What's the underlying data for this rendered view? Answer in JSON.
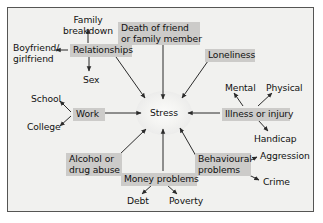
{
  "diagram": {
    "background_color": "#f1f1ef",
    "frame_color": "#555554",
    "shaded_node_color": "#cccbc9",
    "text_color": "#111111",
    "arrow_color": "#2b2b2b",
    "center": {
      "label": "Stress",
      "x": 164,
      "y": 113
    },
    "nodes": [
      {
        "id": "family-breakdown",
        "label": "Family\nbreakdown",
        "style": "plain",
        "x": 62,
        "y": 14,
        "w": 50,
        "align": "center"
      },
      {
        "id": "death-of-friend",
        "label": "Death of friend\nor family member",
        "style": "shaded",
        "x": 118,
        "y": 22,
        "w": 76,
        "align": "left"
      },
      {
        "id": "boyfriend-girlfriend",
        "label": "Boyfriend/\ngirlfriend",
        "style": "plain",
        "x": 12,
        "y": 42,
        "w": 48,
        "align": "left"
      },
      {
        "id": "relationships",
        "label": "Relationships",
        "style": "shaded",
        "x": 70,
        "y": 44,
        "w": 56,
        "align": "left"
      },
      {
        "id": "loneliness",
        "label": "Loneliness",
        "style": "shaded",
        "x": 205,
        "y": 49,
        "w": 44,
        "align": "left"
      },
      {
        "id": "sex",
        "label": "Sex",
        "style": "plain",
        "x": 82,
        "y": 74,
        "w": 20,
        "align": "left"
      },
      {
        "id": "mental",
        "label": "Mental",
        "style": "plain",
        "x": 224,
        "y": 82,
        "w": 28,
        "align": "left"
      },
      {
        "id": "physical",
        "label": "Physical",
        "style": "plain",
        "x": 265,
        "y": 82,
        "w": 32,
        "align": "left"
      },
      {
        "id": "school",
        "label": "School",
        "style": "plain",
        "x": 30,
        "y": 93,
        "w": 28,
        "align": "left"
      },
      {
        "id": "work",
        "label": "Work",
        "style": "shaded",
        "x": 73,
        "y": 108,
        "w": 26,
        "align": "left"
      },
      {
        "id": "illness-or-injury",
        "label": "Illness or injury",
        "style": "shaded",
        "x": 222,
        "y": 108,
        "w": 62,
        "align": "left"
      },
      {
        "id": "college",
        "label": "College",
        "style": "plain",
        "x": 28,
        "y": 121,
        "w": 32,
        "align": "left"
      },
      {
        "id": "handicap",
        "label": "Handicap",
        "style": "plain",
        "x": 253,
        "y": 133,
        "w": 38,
        "align": "left"
      },
      {
        "id": "aggression",
        "label": "Aggression",
        "style": "plain",
        "x": 259,
        "y": 153,
        "w": 44,
        "align": "left"
      },
      {
        "id": "alcohol-drug-abuse",
        "label": "Alcohol or\ndrug abuse",
        "style": "shaded",
        "x": 66,
        "y": 153,
        "w": 50,
        "align": "left"
      },
      {
        "id": "behavioural-problems",
        "label": "Behavioural\nproblems",
        "style": "shaded",
        "x": 195,
        "y": 153,
        "w": 50,
        "align": "left"
      },
      {
        "id": "money-problems",
        "label": "Money problems",
        "style": "shaded",
        "x": 121,
        "y": 173,
        "w": 70,
        "align": "left"
      },
      {
        "id": "crime",
        "label": "Crime",
        "style": "plain",
        "x": 262,
        "y": 177,
        "w": 26,
        "align": "left"
      },
      {
        "id": "debt",
        "label": "Debt",
        "style": "plain",
        "x": 126,
        "y": 196,
        "w": 22,
        "align": "left"
      },
      {
        "id": "poverty",
        "label": "Poverty",
        "style": "plain",
        "x": 168,
        "y": 196,
        "w": 32,
        "align": "left"
      }
    ],
    "edges": [
      {
        "id": "relationships-to-family-breakdown",
        "from": "relationships",
        "to": "family-breakdown"
      },
      {
        "id": "relationships-to-boyfriend-girlfriend",
        "from": "relationships",
        "to": "boyfriend-girlfriend"
      },
      {
        "id": "relationships-to-sex",
        "from": "relationships",
        "to": "sex"
      },
      {
        "id": "relationships-to-stress",
        "from": "relationships",
        "to": "stress"
      },
      {
        "id": "death-of-friend-to-stress",
        "from": "death-of-friend",
        "to": "stress"
      },
      {
        "id": "loneliness-to-stress",
        "from": "loneliness",
        "to": "stress"
      },
      {
        "id": "work-to-school",
        "from": "work",
        "to": "school"
      },
      {
        "id": "work-to-college",
        "from": "work",
        "to": "college"
      },
      {
        "id": "work-to-stress",
        "from": "work",
        "to": "stress"
      },
      {
        "id": "illness-or-injury-to-stress",
        "from": "illness-or-injury",
        "to": "stress"
      },
      {
        "id": "illness-or-injury-to-mental",
        "from": "illness-or-injury",
        "to": "mental"
      },
      {
        "id": "illness-or-injury-to-physical",
        "from": "illness-or-injury",
        "to": "physical"
      },
      {
        "id": "illness-or-injury-to-handicap",
        "from": "illness-or-injury",
        "to": "handicap"
      },
      {
        "id": "alcohol-drug-abuse-to-stress",
        "from": "alcohol-drug-abuse",
        "to": "stress"
      },
      {
        "id": "money-problems-to-stress",
        "from": "money-problems",
        "to": "stress"
      },
      {
        "id": "money-problems-to-debt",
        "from": "money-problems",
        "to": "debt"
      },
      {
        "id": "money-problems-to-poverty",
        "from": "money-problems",
        "to": "poverty"
      },
      {
        "id": "behavioural-problems-to-stress",
        "from": "behavioural-problems",
        "to": "stress"
      },
      {
        "id": "behavioural-problems-to-aggression",
        "from": "behavioural-problems",
        "to": "aggression"
      },
      {
        "id": "behavioural-problems-to-crime",
        "from": "behavioural-problems",
        "to": "crime"
      }
    ]
  }
}
